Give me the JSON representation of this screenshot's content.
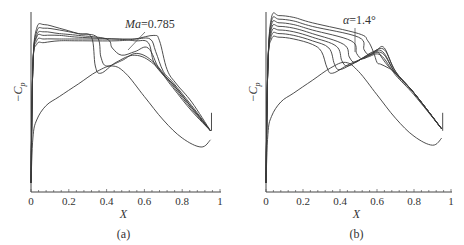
{
  "chart_data": [
    {
      "panel": "a",
      "type": "line",
      "caption": "(a)",
      "xlabel": "X",
      "ylabel": "-Cp",
      "xlim": [
        0,
        1
      ],
      "xticks": [
        "0",
        "0.2",
        "0.4",
        "0.6",
        "0.8",
        "1"
      ],
      "yticks": [],
      "grid": false,
      "annotation": {
        "text_italic": "Ma",
        "text_value": "=0.785"
      },
      "note": "Six Mach-number cases; y in normalized units (0=bottom, 1=top), values estimated",
      "series": [
        {
          "name": "upper-1",
          "x": [
            0,
            0.01,
            0.03,
            0.07,
            0.15,
            0.25,
            0.32,
            0.34,
            0.37,
            0.45,
            0.55,
            0.65,
            0.75,
            0.85,
            0.95
          ],
          "y": [
            0.05,
            0.7,
            0.91,
            0.93,
            0.91,
            0.88,
            0.86,
            0.7,
            0.66,
            0.72,
            0.76,
            0.71,
            0.58,
            0.45,
            0.34
          ]
        },
        {
          "name": "upper-2",
          "x": [
            0,
            0.01,
            0.03,
            0.07,
            0.15,
            0.25,
            0.35,
            0.37,
            0.4,
            0.48,
            0.56,
            0.65,
            0.75,
            0.85,
            0.95
          ],
          "y": [
            0.05,
            0.7,
            0.89,
            0.91,
            0.9,
            0.88,
            0.86,
            0.75,
            0.7,
            0.73,
            0.77,
            0.72,
            0.59,
            0.46,
            0.34
          ]
        },
        {
          "name": "upper-3",
          "x": [
            0,
            0.01,
            0.03,
            0.07,
            0.15,
            0.25,
            0.4,
            0.43,
            0.48,
            0.55,
            0.62,
            0.68,
            0.75,
            0.85,
            0.95
          ],
          "y": [
            0.05,
            0.7,
            0.87,
            0.89,
            0.88,
            0.87,
            0.85,
            0.8,
            0.76,
            0.78,
            0.8,
            0.68,
            0.6,
            0.47,
            0.34
          ]
        },
        {
          "name": "upper-4",
          "x": [
            0,
            0.01,
            0.03,
            0.07,
            0.15,
            0.25,
            0.45,
            0.55,
            0.62,
            0.65,
            0.7,
            0.75,
            0.85,
            0.95
          ],
          "y": [
            0.05,
            0.7,
            0.86,
            0.87,
            0.87,
            0.86,
            0.85,
            0.84,
            0.83,
            0.72,
            0.65,
            0.6,
            0.47,
            0.34
          ]
        },
        {
          "name": "upper-5",
          "x": [
            0,
            0.01,
            0.03,
            0.07,
            0.15,
            0.25,
            0.45,
            0.55,
            0.63,
            0.66,
            0.7,
            0.75,
            0.85,
            0.95
          ],
          "y": [
            0.05,
            0.7,
            0.84,
            0.85,
            0.85,
            0.85,
            0.85,
            0.85,
            0.85,
            0.78,
            0.67,
            0.61,
            0.48,
            0.34
          ]
        },
        {
          "name": "upper-6",
          "x": [
            0,
            0.01,
            0.03,
            0.07,
            0.15,
            0.25,
            0.45,
            0.55,
            0.65,
            0.68,
            0.72,
            0.77,
            0.85,
            0.95
          ],
          "y": [
            0.05,
            0.7,
            0.82,
            0.83,
            0.84,
            0.84,
            0.84,
            0.85,
            0.87,
            0.84,
            0.68,
            0.6,
            0.5,
            0.34
          ]
        },
        {
          "name": "lower",
          "x": [
            0,
            0.01,
            0.03,
            0.08,
            0.15,
            0.25,
            0.35,
            0.43,
            0.5,
            0.6,
            0.7,
            0.8,
            0.9,
            0.95
          ],
          "y": [
            0.05,
            0.3,
            0.4,
            0.48,
            0.53,
            0.6,
            0.67,
            0.7,
            0.66,
            0.53,
            0.4,
            0.3,
            0.25,
            0.29
          ]
        }
      ]
    },
    {
      "panel": "b",
      "type": "line",
      "caption": "(b)",
      "xlabel": "X",
      "ylabel": "-Cp",
      "xlim": [
        0,
        1
      ],
      "xticks": [
        "0",
        "0.2",
        "0.4",
        "0.6",
        "0.8",
        "1"
      ],
      "yticks": [],
      "grid": false,
      "annotation": {
        "text_italic": "α",
        "text_value": "=1.4°"
      },
      "note": "Seven angle-of-attack cases; y in normalized units (0=bottom, 1=top), values estimated",
      "series": [
        {
          "name": "upper-1",
          "x": [
            0,
            0.01,
            0.03,
            0.07,
            0.15,
            0.25,
            0.3,
            0.33,
            0.36,
            0.45,
            0.55,
            0.62,
            0.7,
            0.8,
            0.95
          ],
          "y": [
            0.05,
            0.7,
            0.85,
            0.86,
            0.85,
            0.82,
            0.78,
            0.69,
            0.66,
            0.71,
            0.75,
            0.76,
            0.65,
            0.54,
            0.35
          ]
        },
        {
          "name": "upper-2",
          "x": [
            0,
            0.01,
            0.03,
            0.07,
            0.15,
            0.25,
            0.34,
            0.37,
            0.4,
            0.48,
            0.56,
            0.63,
            0.7,
            0.8,
            0.95
          ],
          "y": [
            0.05,
            0.7,
            0.87,
            0.88,
            0.87,
            0.84,
            0.8,
            0.71,
            0.68,
            0.72,
            0.76,
            0.77,
            0.66,
            0.55,
            0.35
          ]
        },
        {
          "name": "upper-3",
          "x": [
            0,
            0.01,
            0.03,
            0.07,
            0.15,
            0.25,
            0.38,
            0.41,
            0.44,
            0.5,
            0.57,
            0.63,
            0.7,
            0.8,
            0.95
          ],
          "y": [
            0.05,
            0.7,
            0.89,
            0.9,
            0.89,
            0.86,
            0.81,
            0.73,
            0.7,
            0.73,
            0.77,
            0.78,
            0.66,
            0.55,
            0.35
          ]
        },
        {
          "name": "upper-4",
          "x": [
            0,
            0.01,
            0.03,
            0.07,
            0.15,
            0.25,
            0.42,
            0.45,
            0.48,
            0.53,
            0.58,
            0.64,
            0.7,
            0.8,
            0.95
          ],
          "y": [
            0.05,
            0.7,
            0.91,
            0.92,
            0.91,
            0.88,
            0.82,
            0.75,
            0.72,
            0.75,
            0.78,
            0.79,
            0.67,
            0.55,
            0.35
          ]
        },
        {
          "name": "upper-5",
          "x": [
            0,
            0.01,
            0.03,
            0.07,
            0.15,
            0.25,
            0.46,
            0.49,
            0.52,
            0.56,
            0.6,
            0.64,
            0.7,
            0.8,
            0.95
          ],
          "y": [
            0.05,
            0.7,
            0.93,
            0.94,
            0.93,
            0.9,
            0.84,
            0.77,
            0.74,
            0.76,
            0.79,
            0.8,
            0.67,
            0.55,
            0.35
          ]
        },
        {
          "name": "upper-6",
          "x": [
            0,
            0.01,
            0.03,
            0.07,
            0.15,
            0.25,
            0.5,
            0.53,
            0.56,
            0.6,
            0.63,
            0.66,
            0.7,
            0.8,
            0.95
          ],
          "y": [
            0.05,
            0.7,
            0.95,
            0.96,
            0.95,
            0.92,
            0.86,
            0.79,
            0.76,
            0.78,
            0.74,
            0.7,
            0.66,
            0.55,
            0.35
          ]
        },
        {
          "name": "upper-7",
          "x": [
            0,
            0.01,
            0.03,
            0.07,
            0.15,
            0.25,
            0.5,
            0.55,
            0.58,
            0.6,
            0.62,
            0.66,
            0.7,
            0.8,
            0.95
          ],
          "y": [
            0.05,
            0.7,
            0.97,
            0.98,
            0.97,
            0.94,
            0.88,
            0.84,
            0.78,
            0.72,
            0.71,
            0.69,
            0.66,
            0.55,
            0.35
          ]
        },
        {
          "name": "lower",
          "x": [
            0,
            0.01,
            0.03,
            0.08,
            0.15,
            0.25,
            0.35,
            0.43,
            0.5,
            0.6,
            0.7,
            0.8,
            0.9,
            0.95
          ],
          "y": [
            0.05,
            0.32,
            0.42,
            0.5,
            0.55,
            0.62,
            0.69,
            0.72,
            0.67,
            0.54,
            0.41,
            0.31,
            0.26,
            0.3
          ]
        }
      ]
    }
  ]
}
